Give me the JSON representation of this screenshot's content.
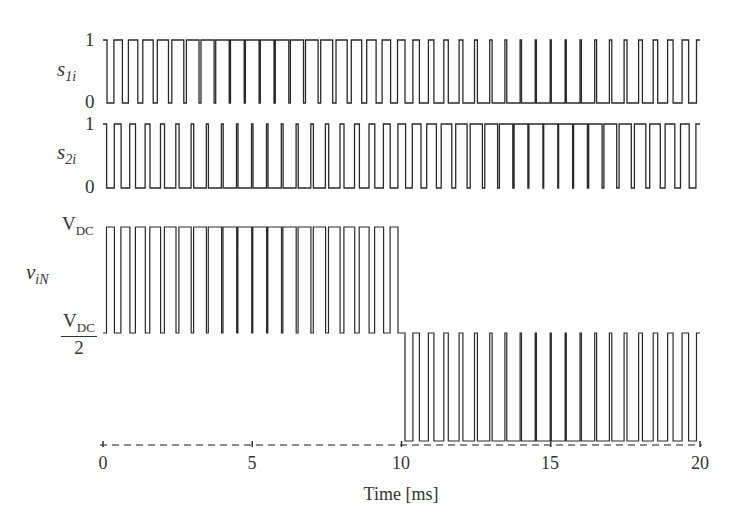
{
  "chart_data": {
    "type": "line",
    "title": "",
    "xlabel": "Time [ms]",
    "xlim": [
      0,
      20
    ],
    "x_ticks": [
      "0",
      "5",
      "10",
      "15",
      "20"
    ],
    "carrier_periods": 40,
    "modulation_index": 0.85,
    "fundamental_period_ms": 20,
    "series": [
      {
        "name": "s1i",
        "label_main": "s",
        "label_sub": "1i",
        "y_ticks": [
          "0",
          "1"
        ],
        "description": "Upper switch gate signal, PWM with duty = 0.5 + 0.5·m·sin(2πt/20ms)",
        "levels": [
          0,
          1
        ]
      },
      {
        "name": "s2i",
        "label_main": "s",
        "label_sub": "2i",
        "y_ticks": [
          "0",
          "1"
        ],
        "description": "Complementary switch gate signal (1 - s1i phase-shifted PWM)",
        "levels": [
          0,
          1
        ]
      },
      {
        "name": "viN",
        "label_main": "v",
        "label_sub": "iN",
        "y_ticks": [
          "VDC/2",
          "VDC"
        ],
        "description": "Phase output voltage: pulses between VDC/2 and VDC for 0–10 ms, between 0 and VDC/2 for 10–20 ms",
        "levels": [
          "0",
          "VDC/2",
          "VDC"
        ]
      }
    ],
    "grid": false,
    "legend": "none",
    "zero_line": "dashed"
  },
  "labels": {
    "y1_top": "1",
    "y1_bottom": "0",
    "y2_top": "1",
    "y2_bottom": "0",
    "s1_main": "s",
    "s1_sub": "1i",
    "s2_main": "s",
    "s2_sub": "2i",
    "v_main": "v",
    "v_sub": "iN",
    "vdc_main": "V",
    "vdc_sub": "DC",
    "half_main": "V",
    "half_sub": "DC",
    "half_den": "2",
    "x0": "0",
    "x5": "5",
    "x10": "10",
    "x15": "15",
    "x20": "20",
    "xlabel": "Time [ms]"
  },
  "colors": {
    "trace": "#2a2a2a",
    "axis_dashed": "#555555",
    "text": "#333333"
  }
}
